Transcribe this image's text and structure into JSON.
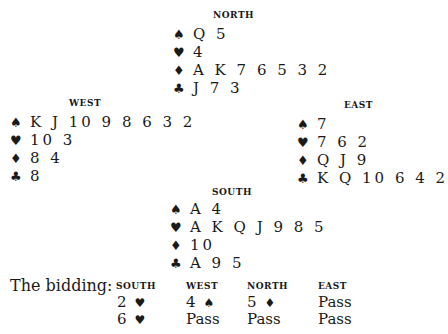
{
  "hands": {
    "north": {
      "title": "NORTH",
      "spades": "Q 5",
      "hearts": "4",
      "diamonds": "A K 7 6 5 3 2",
      "clubs": "J 7 3"
    },
    "west": {
      "title": "WEST",
      "spades": "K J 10 9 8 6 3 2",
      "hearts": "10 3",
      "diamonds": "8 4",
      "clubs": "8"
    },
    "east": {
      "title": "EAST",
      "spades": "7",
      "hearts": "7 6 2",
      "diamonds": "Q J 9",
      "clubs": "K Q 10 6 4 2"
    },
    "south": {
      "title": "SOUTH",
      "spades": "A 4",
      "hearts": "A K Q J 9 8 5",
      "diamonds": "10",
      "clubs": "A 9 5"
    }
  },
  "suits": {
    "spades": "♠",
    "hearts": "♥",
    "diamonds": "♦",
    "clubs": "♣"
  },
  "bidding": {
    "label": "The bidding:",
    "headers": [
      "SOUTH",
      "WEST",
      "NORTH",
      "EAST"
    ],
    "rounds": [
      [
        {
          "level": "2",
          "suit": "♥"
        },
        {
          "level": "4",
          "suit": "♠"
        },
        {
          "level": "5",
          "suit": "♦"
        },
        {
          "level": "Pass",
          "suit": ""
        }
      ],
      [
        {
          "level": "6",
          "suit": "♥"
        },
        {
          "level": "Pass",
          "suit": ""
        },
        {
          "level": "Pass",
          "suit": ""
        },
        {
          "level": "Pass",
          "suit": ""
        }
      ]
    ]
  }
}
